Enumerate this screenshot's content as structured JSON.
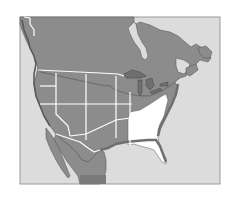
{
  "map": {
    "title": "North America regional map",
    "highlighted_region": "Southeastern United States",
    "regions": [
      {
        "name": "Canada",
        "shade": "gray"
      },
      {
        "name": "Western United States",
        "shade": "gray"
      },
      {
        "name": "Central United States",
        "shade": "gray"
      },
      {
        "name": "Southeastern United States",
        "shade": "white"
      },
      {
        "name": "Northern Mexico",
        "shade": "gray"
      }
    ],
    "features": [
      "Great Lakes",
      "Hudson Bay",
      "Gulf of Mexico",
      "Baja California",
      "Gulf of St. Lawrence"
    ],
    "colors": {
      "background": "#ffffff",
      "frame": "#dcdcdc",
      "frame_border": "#9a9a9a",
      "land": "#8c8c8c",
      "land_dark": "#6f6f6f",
      "coast_shadow": "#5a5a5a",
      "highlight": "#ffffff",
      "borders": "#ffffff",
      "water": "#dcdcdc"
    }
  }
}
